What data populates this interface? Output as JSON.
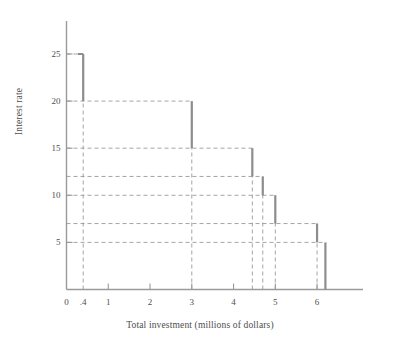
{
  "chart_data": {
    "type": "line",
    "title": "",
    "xlabel": "Total investment (millions of dollars)",
    "ylabel": "Interest rate",
    "xlim": [
      0,
      7.1
    ],
    "ylim": [
      0,
      28.5
    ],
    "grid": true,
    "grid_style": "dashed",
    "legend": "none",
    "x_ticks": [
      {
        "value": 0,
        "label": "0"
      },
      {
        "value": 0.4,
        "label": ".4"
      },
      {
        "value": 1,
        "label": "1"
      },
      {
        "value": 2,
        "label": "2"
      },
      {
        "value": 3,
        "label": "3"
      },
      {
        "value": 4,
        "label": "4"
      },
      {
        "value": 5,
        "label": "5"
      },
      {
        "value": 6,
        "label": "6"
      }
    ],
    "y_ticks": [
      {
        "value": 5,
        "label": "5"
      },
      {
        "value": 10,
        "label": "10"
      },
      {
        "value": 15,
        "label": "15"
      },
      {
        "value": 20,
        "label": "20"
      },
      {
        "value": 25,
        "label": "25"
      }
    ],
    "y_gridlines": [
      5,
      7,
      10,
      12,
      15,
      20,
      25
    ],
    "x_gridlines": [
      0.4,
      3,
      4.45,
      4.7,
      5,
      6,
      6.2
    ],
    "series": [
      {
        "name": "Investment demand schedule",
        "type": "step",
        "color": "#8d8d8d",
        "steps": [
          {
            "x_start": 0,
            "x_end": 0.4,
            "rate": 25
          },
          {
            "x_start": 0.4,
            "x_end": 3,
            "rate": 20
          },
          {
            "x_start": 3,
            "x_end": 4.45,
            "rate": 15
          },
          {
            "x_start": 4.45,
            "x_end": 4.7,
            "rate": 12
          },
          {
            "x_start": 4.7,
            "x_end": 5,
            "rate": 10
          },
          {
            "x_start": 5,
            "x_end": 6,
            "rate": 7
          },
          {
            "x_start": 6,
            "x_end": 6.2,
            "rate": 5
          }
        ],
        "risers": [
          {
            "x": 0.4,
            "y_top": 25,
            "y_bottom": 20
          },
          {
            "x": 3,
            "y_top": 20,
            "y_bottom": 15
          },
          {
            "x": 4.45,
            "y_top": 15,
            "y_bottom": 12
          },
          {
            "x": 4.7,
            "y_top": 12,
            "y_bottom": 10
          },
          {
            "x": 5,
            "y_top": 10,
            "y_bottom": 7
          },
          {
            "x": 6,
            "y_top": 7,
            "y_bottom": 5
          },
          {
            "x": 6.2,
            "y_top": 5,
            "y_bottom": 0
          }
        ]
      }
    ]
  },
  "colors": {
    "axis": "#9a9a9a",
    "grid": "#9a9a9a",
    "step_line": "#8d8d8d",
    "text": "#4e4e4e",
    "background": "#ffffff"
  }
}
